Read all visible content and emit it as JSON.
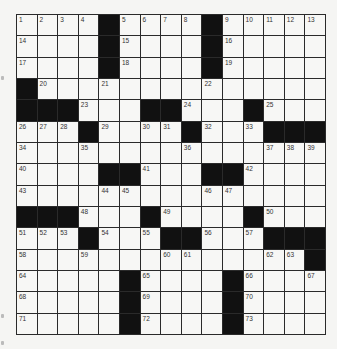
{
  "puzzle": {
    "type": "crossword",
    "size": {
      "rows": 15,
      "cols": 15
    },
    "colors": {
      "background": "#f5f5f3",
      "cell": "#f7f7f5",
      "block": "#111111",
      "grid_line": "#2a2a2a",
      "number": "#333333"
    },
    "grid": [
      [
        1,
        2,
        3,
        4,
        "#",
        5,
        6,
        7,
        8,
        "#",
        9,
        10,
        11,
        12,
        13
      ],
      [
        14,
        0,
        0,
        0,
        "#",
        15,
        0,
        0,
        0,
        "#",
        16,
        0,
        0,
        0,
        0
      ],
      [
        17,
        0,
        0,
        0,
        "#",
        18,
        0,
        0,
        0,
        "#",
        19,
        0,
        0,
        0,
        0
      ],
      [
        "#",
        20,
        0,
        0,
        21,
        0,
        0,
        0,
        0,
        22,
        0,
        0,
        0,
        0,
        0
      ],
      [
        "#",
        "#",
        "#",
        23,
        0,
        0,
        "#",
        "#",
        24,
        0,
        0,
        "#",
        25,
        0,
        0
      ],
      [
        26,
        27,
        28,
        "#",
        29,
        0,
        30,
        31,
        "#",
        32,
        0,
        33,
        "#",
        "#",
        "#"
      ],
      [
        34,
        0,
        0,
        35,
        0,
        0,
        0,
        0,
        36,
        0,
        0,
        0,
        37,
        38,
        39
      ],
      [
        40,
        0,
        0,
        0,
        "#",
        "#",
        41,
        0,
        0,
        "#",
        "#",
        42,
        0,
        0,
        0
      ],
      [
        43,
        0,
        0,
        0,
        44,
        45,
        0,
        0,
        0,
        46,
        47,
        0,
        0,
        0,
        0
      ],
      [
        "#",
        "#",
        "#",
        48,
        0,
        0,
        "#",
        49,
        0,
        0,
        0,
        "#",
        50,
        0,
        0
      ],
      [
        51,
        52,
        53,
        "#",
        54,
        0,
        55,
        "#",
        "#",
        56,
        0,
        57,
        "#",
        "#",
        "#"
      ],
      [
        58,
        0,
        0,
        59,
        0,
        0,
        0,
        60,
        61,
        0,
        0,
        0,
        62,
        63,
        "#"
      ],
      [
        64,
        0,
        0,
        0,
        0,
        "#",
        65,
        0,
        0,
        0,
        "#",
        66,
        0,
        0,
        67
      ],
      [
        68,
        0,
        0,
        0,
        0,
        "#",
        69,
        0,
        0,
        0,
        "#",
        70,
        0,
        0,
        0
      ],
      [
        71,
        0,
        0,
        0,
        0,
        "#",
        72,
        0,
        0,
        0,
        "#",
        73,
        0,
        0,
        0
      ]
    ]
  }
}
